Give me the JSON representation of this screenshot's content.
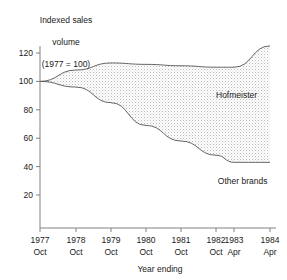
{
  "chart_data": {
    "type": "area",
    "title": "",
    "ylabel_lines": [
      "Indexed sales",
      "volume",
      "(1977 = 100)"
    ],
    "xlabel": "Year ending",
    "categories": [
      "1977\nOct",
      "1978\nOct",
      "1979\nOct",
      "1980\nOct",
      "1981\nOct",
      "1982\nOct",
      "1983\nApr",
      "1984\nApr"
    ],
    "x_tick_years": [
      "1977",
      "1978",
      "1979",
      "1980",
      "1981",
      "1982",
      "1983",
      "1984"
    ],
    "x_tick_months": [
      "Oct",
      "Oct",
      "Oct",
      "Oct",
      "Oct",
      "Oct",
      "Apr",
      "Apr"
    ],
    "y_ticks": [
      20,
      40,
      60,
      80,
      100,
      120
    ],
    "ylim": [
      0,
      130
    ],
    "grid": false,
    "legend_position": "inline-annotation",
    "series": [
      {
        "name": "Hofmeister upper boundary",
        "values": [
          100,
          108,
          113,
          112,
          111,
          110,
          110,
          125
        ]
      },
      {
        "name": "Other brands upper boundary",
        "values": [
          100,
          96,
          85,
          69,
          58,
          48,
          43,
          43
        ]
      }
    ],
    "annotations": [
      {
        "text": "Hofmeister",
        "x_index": 5.0,
        "y_value": 88
      },
      {
        "text": "Other brands",
        "x_index": 5.1,
        "y_value": 28
      }
    ],
    "colors": {
      "band_fill": "#e8e8e8",
      "line": "#555555",
      "axis": "#808080",
      "text": "#1a1a1a"
    }
  }
}
